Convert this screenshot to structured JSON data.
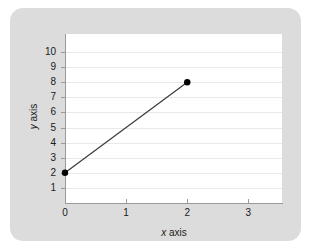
{
  "chart_data": {
    "type": "line",
    "title": "",
    "xlabel": "x axis",
    "ylabel": "y axis",
    "xlim": [
      0,
      3.55
    ],
    "ylim": [
      0,
      11.2
    ],
    "xticks": [
      0,
      1,
      2,
      3
    ],
    "xtick_labels": [
      "0",
      "1",
      "2",
      "3"
    ],
    "yticks": [
      1,
      2,
      3,
      4,
      5,
      6,
      7,
      8,
      9,
      10
    ],
    "ytick_labels": [
      "1",
      "2",
      "3",
      "4",
      "5",
      "6",
      "7",
      "8",
      "9",
      "10"
    ],
    "grid": "horizontal",
    "legend": "none",
    "series": [
      {
        "name": "line",
        "x": [
          0,
          2
        ],
        "y": [
          2,
          8
        ],
        "markers": true,
        "marker_points": [
          {
            "x": 0,
            "y": 2
          },
          {
            "x": 2,
            "y": 8
          }
        ]
      }
    ],
    "colors": {
      "panel_background": "#dcdcdc",
      "plot_background": "#ffffff",
      "gridline": "#e9e9e9",
      "axis": "#9a9a9a",
      "line": "#3a3a3a",
      "marker": "#000000",
      "text": "#1a1a1a"
    }
  },
  "axis_labels": {
    "x_variable": "x",
    "x_word": "axis",
    "y_variable": "y",
    "y_word": "axis"
  }
}
